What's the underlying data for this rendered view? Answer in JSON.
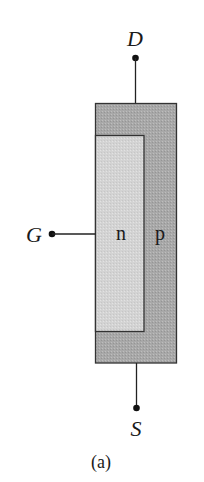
{
  "diagram": {
    "type": "jfet-structure",
    "terminals": {
      "drain": {
        "label": "D"
      },
      "gate": {
        "label": "G"
      },
      "source": {
        "label": "S"
      }
    },
    "regions": {
      "channel": {
        "label": "n",
        "color": "#d4d4d4"
      },
      "body": {
        "label": "p",
        "color": "#a9a9a9"
      }
    },
    "caption": "(a)",
    "colors": {
      "outline": "#333333",
      "lead": "#222222"
    }
  }
}
